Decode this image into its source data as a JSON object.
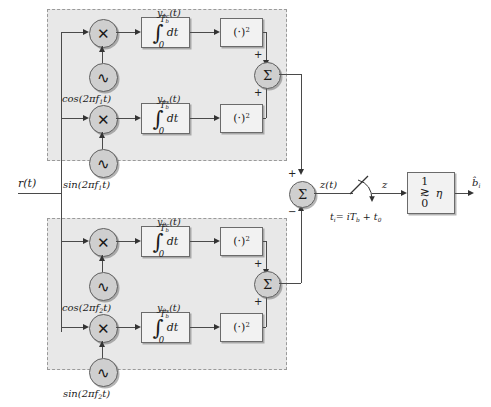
{
  "diagram": {
    "input_label": "r(t)",
    "output_label": "b̂",
    "output_sub": "i",
    "sum_out_label": "z(t)",
    "sampled_label": "z",
    "sampler_label": "t",
    "sampler_sub": "i",
    "sampler_expr": "= iT",
    "sampler_expr_sub": "b",
    "sampler_expr_tail": " + t",
    "sampler_expr_tail_sub": "0",
    "integrator_symbol": "∫",
    "integrator_upper": "T",
    "integrator_upper_sub": "b",
    "integrator_lower": "0",
    "integrator_dt": "dt",
    "squarer_label": "(·)",
    "squarer_exp": "2",
    "multiplier_glyph": "✕",
    "oscillator_glyph": "∿",
    "sum_glyph": "Σ",
    "plus_sign": "+",
    "minus_sign": "−",
    "colors": {
      "panel_fill": "#e8e8e8",
      "panel_border": "#9a9a9a",
      "block_fill": "#f2f2f2",
      "block_border": "#6b6b6b",
      "circle_fill": "#cfcfcf",
      "line": "#4a4a4a"
    },
    "branches": [
      {
        "id": "f1",
        "carrier_cos": "cos(2πf",
        "carrier_cos_sub": "1",
        "carrier_cos_tail": "t)",
        "carrier_sin": "sin(2πf",
        "carrier_sin_sub": "1",
        "carrier_sin_tail": "t)",
        "out_cos": "y",
        "out_cos_sub": "1c",
        "out_cos_tail": "(t)",
        "out_sin": "y",
        "out_sin_sub": "1s",
        "out_sin_tail": "(t)",
        "sum_in_top": "+",
        "sum_in_bottom": "+",
        "main_sum_sign": "+"
      },
      {
        "id": "f2",
        "carrier_cos": "cos(2πf",
        "carrier_cos_sub": "2",
        "carrier_cos_tail": "t)",
        "carrier_sin": "sin(2πf",
        "carrier_sin_sub": "2",
        "carrier_sin_tail": "t)",
        "out_cos": "y",
        "out_cos_sub": "2c",
        "out_cos_tail": "(t)",
        "out_sin": "y",
        "out_sin_sub": "2s",
        "out_sin_tail": "(t)",
        "sum_in_top": "+",
        "sum_in_bottom": "+",
        "main_sum_sign": "−"
      }
    ],
    "decision": {
      "high": "1",
      "relation": "≳",
      "low": "0",
      "threshold": "η"
    }
  }
}
